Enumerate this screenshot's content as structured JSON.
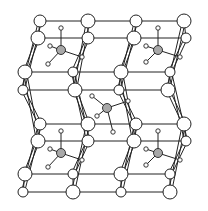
{
  "diagram": {
    "title": "",
    "colors": {
      "line": "#222222",
      "atom_fill": "#ffffff",
      "center_atom": "#a8a8a8",
      "background": "#ffffff"
    },
    "large_atoms": [
      {
        "x": 40,
        "y": 21,
        "r": 6
      },
      {
        "x": 88,
        "y": 21,
        "r": 7
      },
      {
        "x": 136,
        "y": 21,
        "r": 6
      },
      {
        "x": 184,
        "y": 21,
        "r": 7
      },
      {
        "x": 38,
        "y": 38,
        "r": 7
      },
      {
        "x": 88,
        "y": 38,
        "r": 6
      },
      {
        "x": 134,
        "y": 38,
        "r": 7
      },
      {
        "x": 186,
        "y": 38,
        "r": 5
      },
      {
        "x": 25,
        "y": 72,
        "r": 7
      },
      {
        "x": 73,
        "y": 72,
        "r": 5
      },
      {
        "x": 121,
        "y": 72,
        "r": 7
      },
      {
        "x": 170,
        "y": 72,
        "r": 5
      },
      {
        "x": 23,
        "y": 90,
        "r": 5
      },
      {
        "x": 75,
        "y": 90,
        "r": 7
      },
      {
        "x": 119,
        "y": 90,
        "r": 5
      },
      {
        "x": 168,
        "y": 90,
        "r": 7
      },
      {
        "x": 40,
        "y": 124,
        "r": 6
      },
      {
        "x": 88,
        "y": 124,
        "r": 7
      },
      {
        "x": 136,
        "y": 124,
        "r": 6
      },
      {
        "x": 184,
        "y": 124,
        "r": 7
      },
      {
        "x": 38,
        "y": 141,
        "r": 7
      },
      {
        "x": 88,
        "y": 141,
        "r": 6
      },
      {
        "x": 134,
        "y": 141,
        "r": 7
      },
      {
        "x": 186,
        "y": 141,
        "r": 5
      },
      {
        "x": 25,
        "y": 174,
        "r": 7
      },
      {
        "x": 73,
        "y": 174,
        "r": 5
      },
      {
        "x": 121,
        "y": 174,
        "r": 7
      },
      {
        "x": 170,
        "y": 174,
        "r": 5
      },
      {
        "x": 23,
        "y": 192,
        "r": 5
      },
      {
        "x": 73,
        "y": 192,
        "r": 7
      },
      {
        "x": 121,
        "y": 192,
        "r": 5
      },
      {
        "x": 170,
        "y": 192,
        "r": 7
      }
    ],
    "molecules": [
      {
        "cx": 61,
        "cy": 50,
        "ligands": [
          [
            61,
            28
          ],
          [
            50,
            46
          ],
          [
            48,
            64
          ],
          [
            82,
            57
          ]
        ]
      },
      {
        "cx": 158,
        "cy": 50,
        "ligands": [
          [
            158,
            28
          ],
          [
            146,
            46
          ],
          [
            146,
            62
          ],
          [
            180,
            57
          ]
        ]
      },
      {
        "cx": 107,
        "cy": 108,
        "ligands": [
          [
            92,
            96
          ],
          [
            97,
            116
          ],
          [
            113,
            132
          ],
          [
            128,
            101
          ]
        ]
      },
      {
        "cx": 61,
        "cy": 153,
        "ligands": [
          [
            61,
            131
          ],
          [
            50,
            149
          ],
          [
            48,
            167
          ],
          [
            82,
            160
          ]
        ]
      },
      {
        "cx": 158,
        "cy": 153,
        "ligands": [
          [
            158,
            131
          ],
          [
            146,
            149
          ],
          [
            146,
            165
          ],
          [
            180,
            160
          ]
        ]
      }
    ]
  }
}
